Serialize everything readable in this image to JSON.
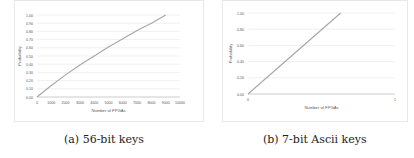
{
  "chart_data": [
    {
      "type": "line",
      "caption": "(a) 56-bit keys",
      "title": "",
      "xlabel": "Number of FPGAs",
      "ylabel": "Probability",
      "xlim": [
        0,
        10000
      ],
      "ylim": [
        0,
        1
      ],
      "x_ticks": [
        "0",
        "1000",
        "2000",
        "3000",
        "4000",
        "5000",
        "6000",
        "7000",
        "8000",
        "9000",
        "10000"
      ],
      "y_ticks": [
        "0.00",
        "0.10",
        "0.20",
        "0.30",
        "0.40",
        "0.50",
        "0.60",
        "0.70",
        "0.80",
        "0.90",
        "1.00"
      ],
      "grid": true,
      "legend": "none",
      "series": [
        {
          "name": "Probability",
          "color": "#a6a6a6",
          "x": [
            0,
            1000,
            2000,
            3000,
            4000,
            5000,
            6000,
            7000,
            8000,
            9000
          ],
          "y": [
            0.0,
            0.14,
            0.27,
            0.39,
            0.5,
            0.61,
            0.71,
            0.81,
            0.9,
            1.0
          ]
        }
      ]
    },
    {
      "type": "line",
      "caption": "(b) 7-bit Ascii keys",
      "title": "",
      "xlabel": "Number of FPGAs",
      "ylabel": "Probability",
      "xlim": [
        0,
        1
      ],
      "ylim": [
        0,
        1
      ],
      "x_ticks": [
        "0",
        "1"
      ],
      "y_ticks": [
        "0.00",
        "0.20",
        "0.40",
        "0.60",
        "0.80",
        "1.00"
      ],
      "grid": true,
      "legend": "none",
      "series": [
        {
          "name": "Probability",
          "color": "#a6a6a6",
          "x": [
            0,
            0.63
          ],
          "y": [
            0.0,
            1.0
          ]
        }
      ]
    }
  ]
}
